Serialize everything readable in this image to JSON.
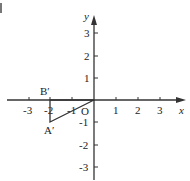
{
  "figure": {
    "axes": {
      "x_label": "x",
      "y_label": "y",
      "origin_label": "O",
      "x_ticks": [
        "-3",
        "-2",
        "-1",
        "1",
        "2",
        "3"
      ],
      "y_ticks": [
        "3",
        "2",
        "1",
        "-1",
        "-2",
        "-3"
      ]
    },
    "points": {
      "b_prime": "B′",
      "a_prime": "A′"
    },
    "triangle": {
      "vertices": [
        {
          "name": "B′",
          "x": -2,
          "y": 0
        },
        {
          "name": "A′",
          "x": -2,
          "y": -1
        },
        {
          "name": "O",
          "x": 0,
          "y": 0
        }
      ]
    },
    "colors": {
      "stroke": "#333333",
      "text": "#222222"
    }
  }
}
